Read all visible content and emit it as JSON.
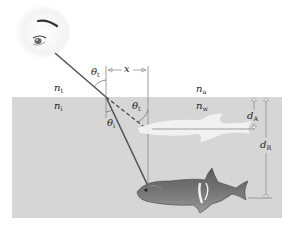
{
  "figure": {
    "colors": {
      "background": "#ffffff",
      "water": "#d6d6d6",
      "ray": "#555555",
      "guide_line": "#888888",
      "apparent_fish": "#f2f2f2",
      "real_fish": "#6a6a6a"
    },
    "labels": {
      "theta_t_top": {
        "symbol": "θ",
        "sub": "t"
      },
      "theta_t_dashed": {
        "symbol": "θ",
        "sub": "t"
      },
      "theta_i": {
        "symbol": "θ",
        "sub": "i"
      },
      "x": {
        "symbol": "x",
        "sub": ""
      },
      "n_t": {
        "symbol": "n",
        "sub": "t"
      },
      "n_i": {
        "symbol": "n",
        "sub": "i"
      },
      "n_a": {
        "symbol": "n",
        "sub": "a"
      },
      "n_w": {
        "symbol": "n",
        "sub": "w"
      },
      "d_A": {
        "symbol": "d",
        "sub": "A"
      },
      "d_R": {
        "symbol": "d",
        "sub": "R"
      }
    },
    "elements": [
      "eye-icon",
      "incident-ray",
      "refracted-ray",
      "dashed-extension",
      "normal-line",
      "water-region",
      "apparent-fish",
      "real-fish",
      "x-dimension",
      "dA-dimension",
      "dR-dimension"
    ]
  }
}
